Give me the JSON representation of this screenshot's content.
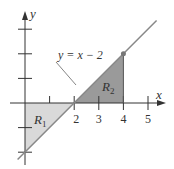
{
  "diagram": {
    "type": "region-area-graph",
    "curve_label": "y = x − 2",
    "curve": {
      "slope": 1,
      "intercept": -2
    },
    "axes": {
      "x_label": "x",
      "y_label": "y",
      "x_ticks": [
        1,
        2,
        3,
        4,
        5
      ],
      "x_tick_labels": [
        "2",
        "3",
        "4",
        "5"
      ],
      "y_ticks": [
        -2,
        -1,
        1,
        2,
        3
      ]
    },
    "regions": [
      {
        "name": "R",
        "sub": "1",
        "vertices": [
          [
            0,
            0
          ],
          [
            2,
            0
          ],
          [
            0,
            -2
          ]
        ],
        "color": "#d9d9d9"
      },
      {
        "name": "R",
        "sub": "2",
        "vertices": [
          [
            2,
            0
          ],
          [
            4,
            0
          ],
          [
            4,
            2
          ]
        ],
        "color": "#9a9a9a"
      }
    ],
    "highlight_point": [
      4,
      2
    ],
    "colors": {
      "line": "#888888",
      "axis": "#333333",
      "text": "#333333"
    }
  }
}
